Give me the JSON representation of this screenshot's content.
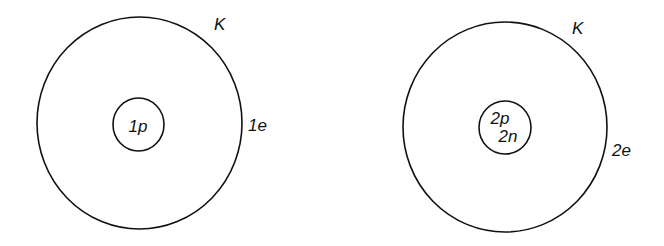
{
  "diagram": {
    "stroke_color": "#111111",
    "background": "#ffffff",
    "atoms": [
      {
        "name": "hydrogen",
        "shell": {
          "label": "K",
          "electrons_label": "1e",
          "cx": 139,
          "cy": 123,
          "r": 103
        },
        "nucleus": {
          "cx": 138,
          "cy": 124,
          "r": 26,
          "lines": [
            "1p"
          ]
        }
      },
      {
        "name": "helium",
        "shell": {
          "label": "K",
          "electrons_label": "2e",
          "cx": 505,
          "cy": 127,
          "r": 103
        },
        "nucleus": {
          "cx": 505,
          "cy": 127,
          "r": 26,
          "lines": [
            "2p",
            "2n"
          ]
        }
      }
    ]
  }
}
